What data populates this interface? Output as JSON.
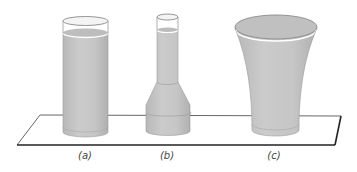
{
  "figure": {
    "colors": {
      "liquid": "#c4c4c4",
      "liquid_dark": "#b3b3b3",
      "outline": "#8a8a8a",
      "platform_edge": "#333333",
      "highlight": "#ffffff"
    },
    "vessels": [
      {
        "id": "a",
        "label": "(a)",
        "shape": "cylinder"
      },
      {
        "id": "b",
        "label": "(b)",
        "shape": "narrow-neck flask"
      },
      {
        "id": "c",
        "label": "(c)",
        "shape": "flared cup"
      }
    ]
  }
}
